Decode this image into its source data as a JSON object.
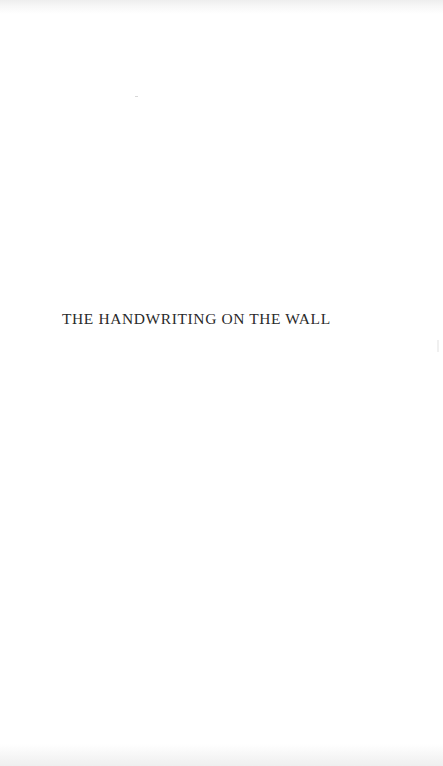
{
  "page": {
    "type": "half-title",
    "title": "THE HANDWRITING ON THE WALL"
  }
}
